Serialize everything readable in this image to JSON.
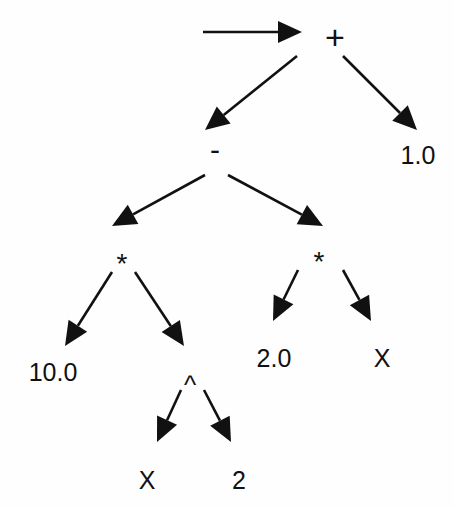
{
  "diagram": {
    "expression": "(10.0 * X^2 - 2.0 * X) + 1.0",
    "colors": {
      "ink": "#111111",
      "background": "#fefefe"
    },
    "nodes": [
      {
        "id": "plus",
        "label": "+",
        "x": 335,
        "y": 37,
        "cls": "op-plus"
      },
      {
        "id": "minus",
        "label": "-",
        "x": 215,
        "y": 150,
        "cls": "op-minus"
      },
      {
        "id": "one",
        "label": "1.0",
        "x": 418,
        "y": 155,
        "cls": "lbl"
      },
      {
        "id": "mul1",
        "label": "*",
        "x": 122,
        "y": 264,
        "cls": "op-star"
      },
      {
        "id": "mul2",
        "label": "*",
        "x": 319,
        "y": 262,
        "cls": "op-star"
      },
      {
        "id": "ten",
        "label": "10.0",
        "x": 53,
        "y": 372,
        "cls": "lbl"
      },
      {
        "id": "pow",
        "label": "^",
        "x": 190,
        "y": 385,
        "cls": "op-caret"
      },
      {
        "id": "two0",
        "label": "2.0",
        "x": 274,
        "y": 358,
        "cls": "lbl"
      },
      {
        "id": "x1",
        "label": "X",
        "x": 382,
        "y": 358,
        "cls": "lbl"
      },
      {
        "id": "x2",
        "label": "X",
        "x": 147,
        "y": 480,
        "cls": "lbl"
      },
      {
        "id": "two",
        "label": "2",
        "x": 239,
        "y": 480,
        "cls": "lbl"
      }
    ],
    "edges": [
      {
        "name": "entry-arrow",
        "x1": 203,
        "y1": 32,
        "x2": 302,
        "y2": 32
      },
      {
        "name": "plus-to-minus",
        "x1": 297,
        "y1": 56,
        "x2": 205,
        "y2": 130
      },
      {
        "name": "plus-to-one",
        "x1": 343,
        "y1": 56,
        "x2": 417,
        "y2": 130
      },
      {
        "name": "minus-to-mul1",
        "x1": 205,
        "y1": 175,
        "x2": 112,
        "y2": 226
      },
      {
        "name": "minus-to-mul2",
        "x1": 228,
        "y1": 175,
        "x2": 323,
        "y2": 226
      },
      {
        "name": "mul1-to-ten",
        "x1": 112,
        "y1": 272,
        "x2": 65,
        "y2": 346
      },
      {
        "name": "mul1-to-pow",
        "x1": 135,
        "y1": 272,
        "x2": 184,
        "y2": 346
      },
      {
        "name": "mul2-to-two0",
        "x1": 298,
        "y1": 270,
        "x2": 273,
        "y2": 321
      },
      {
        "name": "mul2-to-x1",
        "x1": 343,
        "y1": 270,
        "x2": 371,
        "y2": 321
      },
      {
        "name": "pow-to-x2",
        "x1": 181,
        "y1": 390,
        "x2": 157,
        "y2": 442
      },
      {
        "name": "pow-to-two",
        "x1": 204,
        "y1": 390,
        "x2": 231,
        "y2": 442
      }
    ]
  }
}
